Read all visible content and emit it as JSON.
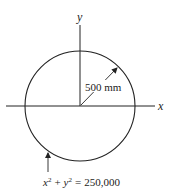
{
  "diagram": {
    "type": "circle-on-axes",
    "axes": {
      "x_label": "x",
      "y_label": "y"
    },
    "radius_label": "500 mm",
    "equation": {
      "x_var": "x",
      "x_exp": "2",
      "plus": "+",
      "y_var": "y",
      "y_exp": "2",
      "equals": "=",
      "value": "250,000"
    },
    "colors": {
      "stroke": "#222222",
      "background": "#ffffff"
    }
  }
}
